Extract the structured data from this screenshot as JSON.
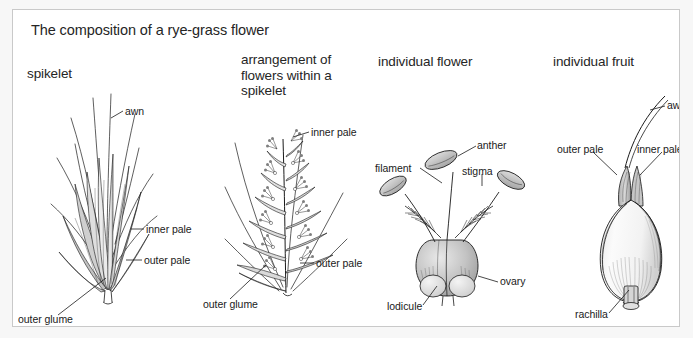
{
  "figure": {
    "title": "The composition of a rye-grass flower",
    "background_color": "#ffffff",
    "outer_color": "#f7f7f7",
    "border_color": "#c9c9c9",
    "ink_color": "#1a1a1a",
    "shade_light": "#e8e8e8",
    "shade_mid": "#c4c4c4",
    "shade_dark": "#9a9a9a"
  },
  "panels": [
    {
      "id": "spikelet",
      "heading": "spikelet",
      "labels": [
        {
          "id": "awn",
          "text": "awn"
        },
        {
          "id": "inner-pale",
          "text": "inner pale"
        },
        {
          "id": "outer-pale",
          "text": "outer pale"
        },
        {
          "id": "outer-glume",
          "text": "outer glume"
        }
      ]
    },
    {
      "id": "arrangement",
      "heading": "arrangement of flowers within a spikelet",
      "labels": [
        {
          "id": "inner-pale",
          "text": "inner pale"
        },
        {
          "id": "outer-pale",
          "text": "outer pale"
        },
        {
          "id": "outer-glume",
          "text": "outer glume"
        }
      ]
    },
    {
      "id": "individual-flower",
      "heading": "individual flower",
      "labels": [
        {
          "id": "anther",
          "text": "anther"
        },
        {
          "id": "filament",
          "text": "filament"
        },
        {
          "id": "stigma",
          "text": "stigma"
        },
        {
          "id": "ovary",
          "text": "ovary"
        },
        {
          "id": "lodicule",
          "text": "lodicule"
        }
      ]
    },
    {
      "id": "individual-fruit",
      "heading": "individual fruit",
      "labels": [
        {
          "id": "awn",
          "text": "awn"
        },
        {
          "id": "outer-pale",
          "text": "outer pale"
        },
        {
          "id": "inner-pale",
          "text": "inner pale"
        },
        {
          "id": "rachilla",
          "text": "rachilla"
        }
      ]
    }
  ]
}
